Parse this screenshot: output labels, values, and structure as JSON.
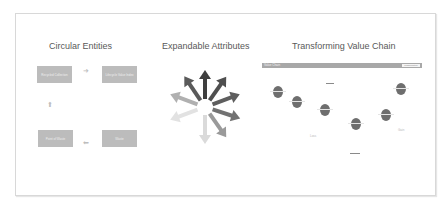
{
  "sections": {
    "circular": {
      "title": "Circular Entities",
      "boxes": [
        "Recycled Collection",
        "Lifecycle Value Index",
        "Point of Waste",
        "Waste"
      ],
      "arrows": [
        "arrow-right",
        "arrow-up",
        "arrow-left"
      ]
    },
    "expandable": {
      "title": "Expandable Attributes",
      "arrow_count": 9,
      "colors": [
        "#4a4a4a",
        "#5a5a5a",
        "#6a6a6a",
        "#7a7a7a",
        "#8e8e8e",
        "#a4a4a4",
        "#bcbcbc",
        "#d0d0d0",
        "#e0e0e0"
      ]
    },
    "value_chain": {
      "title": "Transforming Value Chain",
      "bar_left": "Value Chain",
      "bar_right": "Transformation",
      "top_label": "Input",
      "bottom_label": "Output",
      "side_labels": [
        "Loss",
        "Gain"
      ],
      "node_labels": [
        "Source",
        "Make",
        "Use",
        "Dispose",
        "Recover",
        "Reuse"
      ]
    }
  }
}
